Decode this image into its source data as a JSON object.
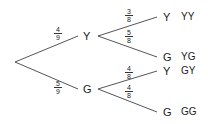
{
  "tree": {
    "level1": [
      {
        "label": "Y",
        "prob_num": "4",
        "prob_den": "9"
      },
      {
        "label": "G",
        "prob_num": "5",
        "prob_den": "9"
      }
    ],
    "level2": [
      {
        "parent": "Y",
        "label": "Y",
        "prob_num": "3",
        "prob_den": "8",
        "outcome": "YY"
      },
      {
        "parent": "Y",
        "label": "G",
        "prob_num": "5",
        "prob_den": "8",
        "outcome": "YG"
      },
      {
        "parent": "G",
        "label": "Y",
        "prob_num": "4",
        "prob_den": "8",
        "outcome": "GY"
      },
      {
        "parent": "G",
        "label": "G",
        "prob_num": "4",
        "prob_den": "8",
        "outcome": "GG"
      }
    ]
  }
}
